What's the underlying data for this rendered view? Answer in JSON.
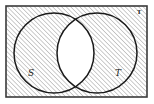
{
  "figure": {
    "kind": "venn-diagram",
    "description": "Rectangular universal set with diagonal hatching everywhere except the lens-shaped overlap of two circles",
    "background_color": "#ffffff"
  },
  "universe": {
    "label": "ᵁ",
    "label_text": "U",
    "border_color": "#3a3a3a",
    "border_width": 1.6,
    "fill": "hatched",
    "hatch_color": "#8c8c8c",
    "hatch_angle_deg": 45,
    "hatch_spacing_px": 3.2
  },
  "sets": [
    {
      "id": "S",
      "label": "S",
      "position": "left",
      "stroke_color": "#1a1a1a",
      "stroke_width": 1.5,
      "center_x": 54,
      "center_y": 53,
      "radius": 40
    },
    {
      "id": "T",
      "label": "T",
      "position": "right",
      "stroke_color": "#1a1a1a",
      "stroke_width": 1.5,
      "center_x": 97,
      "center_y": 53,
      "radius": 40
    }
  ],
  "regions": {
    "intersection": {
      "name": "S ∩ T",
      "shading": "none",
      "fill_color": "#ffffff"
    },
    "complement_of_intersection": {
      "name": "(S ∩ T)′",
      "shading": "diagonal-hatch"
    }
  },
  "labels": {
    "left_set": "S",
    "right_set": "T",
    "universe": "ᵁ"
  }
}
